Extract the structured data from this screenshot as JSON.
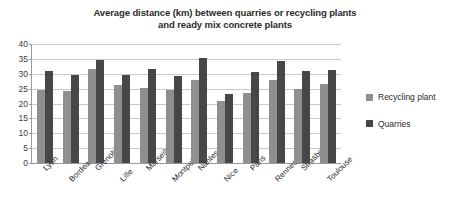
{
  "chart_data": {
    "type": "bar",
    "title": "Average distance (km) between quarries or recycling plants and ready mix concrete plants",
    "title_lines": [
      "Average distance (km) between quarries or recycling plants",
      "and ready mix concrete plants"
    ],
    "xlabel": "",
    "ylabel": "",
    "ylim": [
      0,
      40
    ],
    "yticks": [
      0,
      5,
      10,
      15,
      20,
      25,
      30,
      35,
      40
    ],
    "grid": true,
    "legend_position": "right",
    "categories": [
      "Lyon",
      "Bordeaux",
      "Grenoble",
      "Lille",
      "Marseille",
      "Montpellier",
      "Nantes",
      "Nice",
      "Paris",
      "Rennes",
      "Strasbourg",
      "Toulouse"
    ],
    "series": [
      {
        "name": "Recycling plant",
        "color": "#8f8f8f",
        "values": [
          24.5,
          24.3,
          31.5,
          26.3,
          25.1,
          24.4,
          28.0,
          21.0,
          23.4,
          27.9,
          25.0,
          26.5
        ]
      },
      {
        "name": "Quarries",
        "color": "#474747",
        "values": [
          31.0,
          29.7,
          34.5,
          29.6,
          31.6,
          29.1,
          35.2,
          23.2,
          30.7,
          34.2,
          31.0,
          31.2
        ]
      }
    ]
  }
}
